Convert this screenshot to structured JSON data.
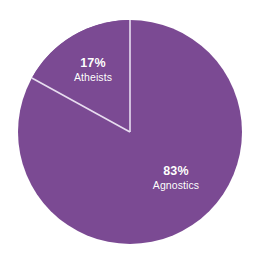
{
  "chart_data": {
    "type": "pie",
    "title": "",
    "subtitle": "",
    "xlabel": "",
    "ylabel": "",
    "legend": "none",
    "grid": false,
    "categories": [
      "Atheists",
      "Agnostics"
    ],
    "values": [
      17,
      83
    ],
    "unit": "%",
    "slices": [
      {
        "label": "Atheists",
        "value": 17,
        "value_text": "17%",
        "color": "#7B4A93",
        "start_angle_deg": 0,
        "end_angle_deg": 61.2
      },
      {
        "label": "Agnostics",
        "value": 83,
        "value_text": "83%",
        "color": "#7B4A93",
        "start_angle_deg": 61.2,
        "end_angle_deg": 360
      }
    ]
  },
  "figure": {
    "background_color": "#ffffff",
    "slice_fill_color": "#7B4A93",
    "divider_color": "#E8DDF0",
    "label_color": "#ffffff",
    "center_x": 130,
    "center_y": 132,
    "radius": 112
  }
}
